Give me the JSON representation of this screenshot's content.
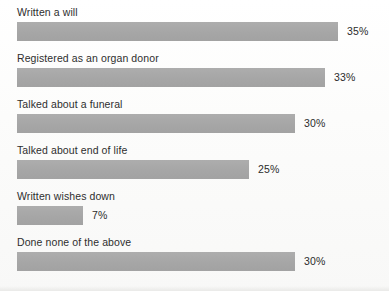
{
  "chart_data": {
    "type": "bar",
    "orientation": "horizontal",
    "title": "",
    "subtitle": "",
    "xlabel": "",
    "ylabel": "",
    "grid": false,
    "legend": null,
    "value_suffix": "%",
    "axis_max": 38,
    "categories": [
      "Written a will",
      "Registered as an organ donor",
      "Talked about a funeral",
      "Talked about end of life",
      "Written wishes down",
      "Done none of the above"
    ],
    "values": [
      35,
      33,
      30,
      25,
      7,
      30
    ],
    "value_labels": [
      "35%",
      "33%",
      "30%",
      "25%",
      "7%",
      "30%"
    ],
    "bars": [
      {
        "label": "Written a will",
        "value": 35,
        "value_label": "35%",
        "bar_width_px": 321
      },
      {
        "label": "Registered as an organ donor",
        "value": 33,
        "value_label": "33%",
        "bar_width_px": 308
      },
      {
        "label": "Talked about a funeral",
        "value": 30,
        "value_label": "30%",
        "bar_width_px": 278
      },
      {
        "label": "Talked about end of life",
        "value": 25,
        "value_label": "25%",
        "bar_width_px": 232
      },
      {
        "label": "Written wishes down",
        "value": 7,
        "value_label": "7%",
        "bar_width_px": 66
      },
      {
        "label": "Done none of the above",
        "value": 30,
        "value_label": "30%",
        "bar_width_px": 278
      }
    ],
    "colors": {
      "bar": "#a9a9a9",
      "label_text": "#2e2e2e",
      "value_text": "#2b2b2b",
      "background": "#fdfdfc"
    }
  }
}
